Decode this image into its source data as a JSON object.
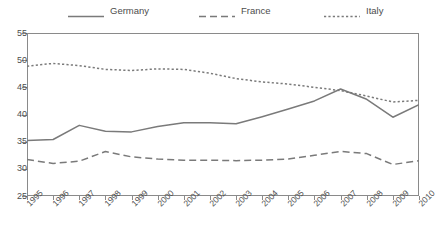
{
  "chart_data": {
    "type": "line",
    "title": "",
    "xlabel": "",
    "ylabel": "",
    "x": [
      1995,
      1996,
      1997,
      1998,
      1999,
      2000,
      2001,
      2002,
      2003,
      2004,
      2005,
      2006,
      2007,
      2008,
      2009,
      2010
    ],
    "categories": [
      "1995",
      "1996",
      "1997",
      "1998",
      "1999",
      "2000",
      "2001",
      "2002",
      "2003",
      "2004",
      "2005",
      "2006",
      "2007",
      "2008",
      "2009",
      "2010"
    ],
    "ylim": [
      25,
      55
    ],
    "yticks": [
      25,
      30,
      35,
      40,
      45,
      50,
      55
    ],
    "ytick_labels": [
      "25",
      "30",
      "35",
      "40",
      "45",
      "50",
      "55"
    ],
    "grid": false,
    "legend_position": "top",
    "series": [
      {
        "name": "Germany",
        "style": "solid",
        "color": "#7a7a7a",
        "values": [
          35.2,
          35.4,
          38.0,
          36.9,
          36.8,
          37.8,
          38.5,
          38.5,
          38.3,
          39.6,
          41.0,
          42.5,
          44.7,
          42.8,
          39.5,
          41.8
        ]
      },
      {
        "name": "France",
        "style": "dashed",
        "color": "#7a7a7a",
        "values": [
          31.7,
          31.0,
          31.4,
          33.2,
          32.2,
          31.8,
          31.6,
          31.6,
          31.5,
          31.6,
          31.8,
          32.5,
          33.2,
          32.8,
          30.8,
          31.5
        ]
      },
      {
        "name": "Italy",
        "style": "dotted",
        "color": "#7a7a7a",
        "values": [
          48.9,
          49.4,
          49.0,
          48.3,
          48.1,
          48.4,
          48.3,
          47.6,
          46.6,
          46.0,
          45.6,
          45.0,
          44.4,
          43.4,
          42.3,
          42.6
        ]
      }
    ]
  },
  "legend": {
    "items": [
      {
        "label": "Germany"
      },
      {
        "label": "France"
      },
      {
        "label": "Italy"
      }
    ]
  }
}
